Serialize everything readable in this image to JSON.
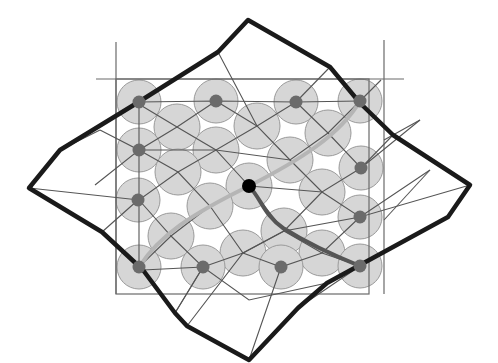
{
  "diagram": {
    "title": "Deformed mesh with circle-packed nodes and paths",
    "canvas": {
      "width": 498,
      "height": 363
    },
    "colors": {
      "background": "#ffffff",
      "circle_fill": "#d6d6d6",
      "circle_stroke": "#9a9a9a",
      "grid_line": "#555555",
      "frame_line": "#6a6a6a",
      "outline": "#1a1a1a",
      "node": "#6b6b6b",
      "center_node": "#000000",
      "light_path": "#b5b5b5",
      "dark_path": "#555555"
    },
    "frame": {
      "rect": {
        "x": 116,
        "y": 79,
        "w": 253,
        "h": 215
      },
      "top_extension": {
        "x1": 96,
        "y1": 79,
        "x2": 404,
        "y2": 79
      },
      "left_extension": {
        "x1": 116,
        "y1": 42,
        "x2": 116,
        "y2": 294
      },
      "right_extension": {
        "x1": 384,
        "y1": 40,
        "x2": 384,
        "y2": 294
      }
    },
    "outline_polygon": [
      [
        248,
        20
      ],
      [
        330,
        67
      ],
      [
        360,
        103
      ],
      [
        393,
        135
      ],
      [
        470,
        185
      ],
      [
        448,
        217
      ],
      [
        327,
        283
      ],
      [
        298,
        308
      ],
      [
        249,
        360
      ],
      [
        187,
        326
      ],
      [
        175,
        313
      ],
      [
        143,
        270
      ],
      [
        102,
        232
      ],
      [
        29,
        188
      ],
      [
        60,
        150
      ],
      [
        137,
        103
      ],
      [
        218,
        52
      ]
    ],
    "circles": [
      {
        "cx": 139,
        "cy": 102,
        "r": 22,
        "node": true
      },
      {
        "cx": 216,
        "cy": 101,
        "r": 22,
        "node": true
      },
      {
        "cx": 296,
        "cy": 102,
        "r": 22,
        "node": true
      },
      {
        "cx": 360,
        "cy": 101,
        "r": 22,
        "node": true
      },
      {
        "cx": 177,
        "cy": 127,
        "r": 23,
        "node": false
      },
      {
        "cx": 257,
        "cy": 126,
        "r": 23,
        "node": false
      },
      {
        "cx": 328,
        "cy": 133,
        "r": 23,
        "node": false
      },
      {
        "cx": 139,
        "cy": 150,
        "r": 22,
        "node": true
      },
      {
        "cx": 216,
        "cy": 150,
        "r": 23,
        "node": false
      },
      {
        "cx": 290,
        "cy": 160,
        "r": 23,
        "node": false
      },
      {
        "cx": 361,
        "cy": 168,
        "r": 22,
        "node": true
      },
      {
        "cx": 178,
        "cy": 172,
        "r": 23,
        "node": false
      },
      {
        "cx": 249,
        "cy": 186,
        "r": 23,
        "node": false
      },
      {
        "cx": 138,
        "cy": 200,
        "r": 22,
        "node": true
      },
      {
        "cx": 210,
        "cy": 206,
        "r": 23,
        "node": false
      },
      {
        "cx": 322,
        "cy": 192,
        "r": 23,
        "node": false
      },
      {
        "cx": 360,
        "cy": 217,
        "r": 22,
        "node": true
      },
      {
        "cx": 284,
        "cy": 231,
        "r": 23,
        "node": false
      },
      {
        "cx": 171,
        "cy": 236,
        "r": 23,
        "node": false
      },
      {
        "cx": 243,
        "cy": 253,
        "r": 23,
        "node": false
      },
      {
        "cx": 322,
        "cy": 253,
        "r": 23,
        "node": false
      },
      {
        "cx": 139,
        "cy": 267,
        "r": 22,
        "node": true
      },
      {
        "cx": 203,
        "cy": 267,
        "r": 22,
        "node": true
      },
      {
        "cx": 281,
        "cy": 267,
        "r": 22,
        "node": true
      },
      {
        "cx": 360,
        "cy": 266,
        "r": 22,
        "node": true
      },
      {
        "cx": 176,
        "cy": 207,
        "r": 0,
        "node": false
      }
    ],
    "center_node": {
      "cx": 249,
      "cy": 186,
      "r": 7
    },
    "grid_lines_a": [
      "M 60 150 L 139 102 L 216 101 L 296 102 L 360 101",
      "M 100 130 L 139 150 L 177 127 L 216 101",
      "M 95 185 L 139 150 L 216 150 L 257 126 L 296 102",
      "M 29 188 L 139 200 L 178 172 L 216 150 L 290 160 L 328 133 L 360 101",
      "M 102 232 L 139 267 L 171 236 L 210 206 L 249 186 L 322 192 L 361 168 L 420 120",
      "M 143 270 L 203 267 L 243 253 L 284 231 L 322 192",
      "M 187 326 L 243 253 L 284 231 L 360 217 L 430 170",
      "M 249 360 L 281 267 L 322 253 L 360 217",
      "M 298 308 L 360 266 L 448 217"
    ],
    "grid_lines_b": [
      "M 137 103 L 177 127 L 216 150 L 249 186 L 284 231 L 322 253 L 360 266",
      "M 218 52 L 257 126 L 290 160 L 322 192 L 360 217 L 470 185",
      "M 216 101 L 257 126",
      "M 296 102 L 328 133 L 361 168 L 393 135",
      "M 330 67 L 296 102",
      "M 139 150 L 178 172 L 210 206 L 243 253 L 281 267",
      "M 139 200 L 171 236 L 203 267 L 175 313",
      "M 139 102 L 139 150 L 139 200 L 139 267",
      "M 60 150 L 100 130",
      "M 102 232 L 138 200",
      "M 175 313 L 203 267 L 249 300 L 327 283",
      "M 381 80 L 360 101",
      "M 384 140 L 420 120",
      "M 384 220 L 430 170"
    ],
    "light_path": "M 139 267 C 160 235, 190 215, 249 186 C 300 160, 340 135, 360 101",
    "dark_path": "M 249 186 C 262 200, 264 215, 283 228 C 310 245, 340 258, 360 266",
    "nodes": [
      {
        "cx": 139,
        "cy": 102
      },
      {
        "cx": 216,
        "cy": 101
      },
      {
        "cx": 296,
        "cy": 102
      },
      {
        "cx": 360,
        "cy": 101
      },
      {
        "cx": 139,
        "cy": 150
      },
      {
        "cx": 361,
        "cy": 168
      },
      {
        "cx": 138,
        "cy": 200
      },
      {
        "cx": 360,
        "cy": 217
      },
      {
        "cx": 139,
        "cy": 267
      },
      {
        "cx": 203,
        "cy": 267
      },
      {
        "cx": 281,
        "cy": 267
      },
      {
        "cx": 360,
        "cy": 266
      }
    ]
  }
}
